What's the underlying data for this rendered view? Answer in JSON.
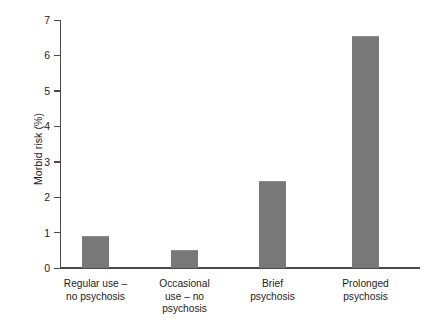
{
  "chart_data": {
    "type": "bar",
    "title": "",
    "xlabel": "",
    "ylabel": "Morbid risk (%)",
    "categories": [
      "Regular use –\nno psychosis",
      "Occasional\nuse – no\npsychosis",
      "Brief\npsychosis",
      "Prolonged\npsychosis"
    ],
    "category_lines": [
      [
        "Regular use –",
        "no psychosis"
      ],
      [
        "Occasional",
        "use – no",
        "psychosis"
      ],
      [
        "Brief",
        "psychosis"
      ],
      [
        "Prolonged",
        "psychosis"
      ]
    ],
    "values": [
      0.9,
      0.5,
      2.45,
      6.55
    ],
    "ylim": [
      0,
      7
    ],
    "yticks": [
      0,
      1,
      2,
      3,
      4,
      5,
      6,
      7
    ],
    "ytick_labels": [
      "0",
      "1",
      "2",
      "3",
      "4",
      "5",
      "6",
      "7"
    ],
    "grid": false,
    "legend": null,
    "bar_color": "#787878",
    "axis_color": "#4a4a4a",
    "background": "#ffffff"
  },
  "axis": {
    "y_label": "Morbid risk (%)"
  }
}
